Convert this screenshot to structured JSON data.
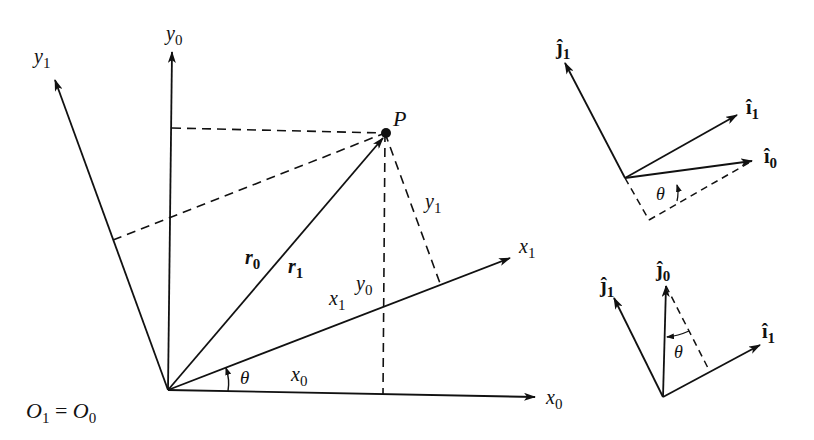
{
  "figure": {
    "main_diagram": {
      "origin_label": {
        "a": "O",
        "a_sub": "1",
        "eq": " = ",
        "b": "O",
        "b_sub": "0"
      },
      "axes": {
        "x0": {
          "base": "x",
          "sub": "0"
        },
        "y0": {
          "base": "y",
          "sub": "0"
        },
        "x1": {
          "base": "x",
          "sub": "1"
        },
        "y1": {
          "base": "y",
          "sub": "1"
        }
      },
      "point_label": "P",
      "vector_labels": {
        "r0": {
          "base": "r",
          "sub": "0"
        },
        "r1": {
          "base": "r",
          "sub": "1"
        }
      },
      "projection_labels": {
        "x0": {
          "base": "x",
          "sub": "0"
        },
        "y0": {
          "base": "y",
          "sub": "0"
        },
        "x1": {
          "base": "x",
          "sub": "1"
        },
        "y1": {
          "base": "y",
          "sub": "1"
        }
      },
      "angle_label": "θ"
    },
    "top_right_diagram": {
      "j1": {
        "base": "ĵ",
        "sub": "1"
      },
      "i1": {
        "base": "î",
        "sub": "1"
      },
      "i0": {
        "base": "î",
        "sub": "0"
      },
      "angle_label": "θ"
    },
    "bottom_right_diagram": {
      "j1": {
        "base": "ĵ",
        "sub": "1"
      },
      "j0": {
        "base": "ĵ",
        "sub": "0"
      },
      "i1": {
        "base": "î",
        "sub": "1"
      },
      "angle_label": "θ"
    }
  }
}
